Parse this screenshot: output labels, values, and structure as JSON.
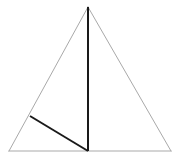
{
  "figure": {
    "kind": "geometry-diagram",
    "background_color": "#ffffff",
    "canvas": {
      "width": 181,
      "height": 159
    }
  },
  "chart_data": {
    "type": "diagram",
    "xlabel": "",
    "ylabel": "",
    "grid": false,
    "legend": false,
    "xlim": [
      0,
      181
    ],
    "ylim": [
      0,
      159
    ],
    "points": [
      {
        "id": "apex",
        "label": "",
        "x": 88,
        "y": 7
      },
      {
        "id": "bottom-left",
        "label": "",
        "x": 9,
        "y": 151
      },
      {
        "id": "bottom-right",
        "label": "",
        "x": 171,
        "y": 151
      },
      {
        "id": "base-midpoint",
        "label": "",
        "x": 88,
        "y": 151
      },
      {
        "id": "left-edge-point",
        "label": "",
        "x": 30,
        "y": 116
      }
    ],
    "shapes": [
      {
        "id": "triangle-outline",
        "name": "triangle",
        "role": "outer-boundary",
        "vertices": [
          [
            88,
            7
          ],
          [
            9,
            151
          ],
          [
            171,
            151
          ]
        ],
        "stroke": "#a9a9a9",
        "stroke_width": 1,
        "fill": "#ffffff",
        "closed": true
      },
      {
        "id": "median-line",
        "name": "vertical-median",
        "role": "apex-to-base-midpoint",
        "from": [
          88,
          7
        ],
        "to": [
          88,
          151
        ],
        "stroke": "#1a1a1a",
        "stroke_width": 2,
        "closed": false
      },
      {
        "id": "cevian-line",
        "name": "diagonal-cevian",
        "role": "left-edge-to-base-midpoint",
        "from": [
          30,
          116
        ],
        "to": [
          88,
          151
        ],
        "stroke": "#1a1a1a",
        "stroke_width": 2,
        "closed": false
      }
    ],
    "colors": {
      "outline": "#a9a9a9",
      "inner": "#1a1a1a",
      "background": "#ffffff"
    }
  }
}
